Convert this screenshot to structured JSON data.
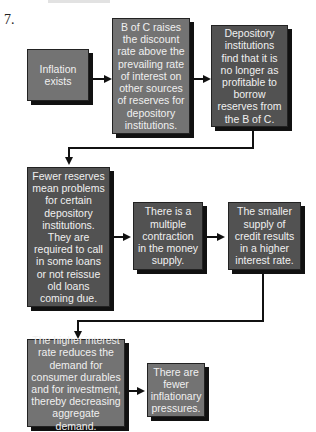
{
  "problem_number": "7.",
  "boxes": {
    "inflation": "Inflation exists",
    "boc_raises": "B of C raises the discount rate above the prevailing rate of interest on other sources of reserves for depository institutions.",
    "depository_find": "Depository institutions find that it is no longer as profitable to borrow reserves from the B of C.",
    "fewer_reserves": "Fewer reserves mean problems for certain depository institutions. They are required to call in some loans or not reissue old loans coming due.",
    "multiple_contraction": "There is a multiple contraction in the money supply.",
    "smaller_supply": "The smaller supply of credit results in a higher interest rate.",
    "higher_interest": "The higher interest rate reduces the demand for consumer durables and for investment, thereby decreasing aggregate demand.",
    "fewer_pressures": "There are fewer inflationary pressures."
  },
  "colors": {
    "light_box": "#737373",
    "dark_box": "#525252",
    "text": "#f0f0f0",
    "shadow": "#111111"
  }
}
